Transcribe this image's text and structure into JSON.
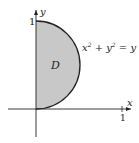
{
  "diagram": {
    "region_label": "D",
    "curve_label": {
      "base": "x",
      "exp1": "2",
      "mid": " + y",
      "exp2": "2",
      "rhs": " = y"
    },
    "x_axis_label": "x",
    "y_axis_label": "y",
    "y_tick_label": "1",
    "x_tick_label": "1",
    "fill_color": "#c8c8c8",
    "stroke_color": "#222222"
  }
}
